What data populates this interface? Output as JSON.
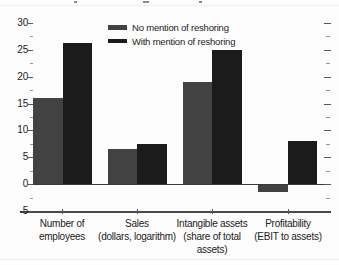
{
  "chart_data": {
    "type": "bar",
    "title": "",
    "categories": [
      "Number of employees",
      "Sales (dollars, logarithm)",
      "Intangible assets (share of total assets)",
      "Profitability (EBIT to assets)"
    ],
    "category_lines": [
      [
        "Number of",
        "employees"
      ],
      [
        "Sales",
        "(dollars, logarithm)"
      ],
      [
        "Intangible assets",
        "(share of total",
        "assets)"
      ],
      [
        "Profitability",
        "(EBIT to assets)"
      ]
    ],
    "series": [
      {
        "name": "No mention of reshoring",
        "color": "#424242",
        "values": [
          16,
          6.5,
          19,
          -1.3
        ]
      },
      {
        "name": "With mention of reshoring",
        "color": "#1b1b1b",
        "values": [
          26.2,
          7.4,
          25,
          8
        ]
      }
    ],
    "xlabel": "",
    "ylabel": "",
    "ylim": [
      -5,
      30
    ],
    "y_tick_labels": [
      "30",
      "25",
      "20",
      "15",
      "10",
      "5",
      "0",
      "-5"
    ],
    "y_major_ticks": [
      30,
      25,
      20,
      15,
      10,
      5,
      0
    ],
    "y_minor_ticks": [
      27.5,
      22.5,
      17.5,
      12.5,
      7.5,
      2.5,
      -2.5
    ],
    "grid": "zero baseline only, mirrored ticks on right axis",
    "legend_position": "top-center"
  }
}
